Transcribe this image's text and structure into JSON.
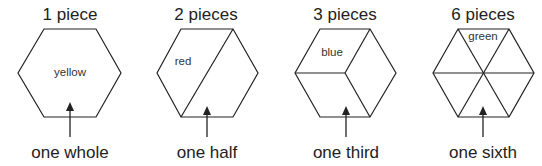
{
  "panels": [
    {
      "title": "1 piece",
      "piece_label": "yellow",
      "caption": "one whole",
      "pieces": 1
    },
    {
      "title": "2 pieces",
      "piece_label": "red",
      "caption": "one half",
      "pieces": 2
    },
    {
      "title": "3 pieces",
      "piece_label": "blue",
      "caption": "one third",
      "pieces": 3
    },
    {
      "title": "6 pieces",
      "piece_label": "green",
      "caption": "one sixth",
      "pieces": 6
    }
  ]
}
